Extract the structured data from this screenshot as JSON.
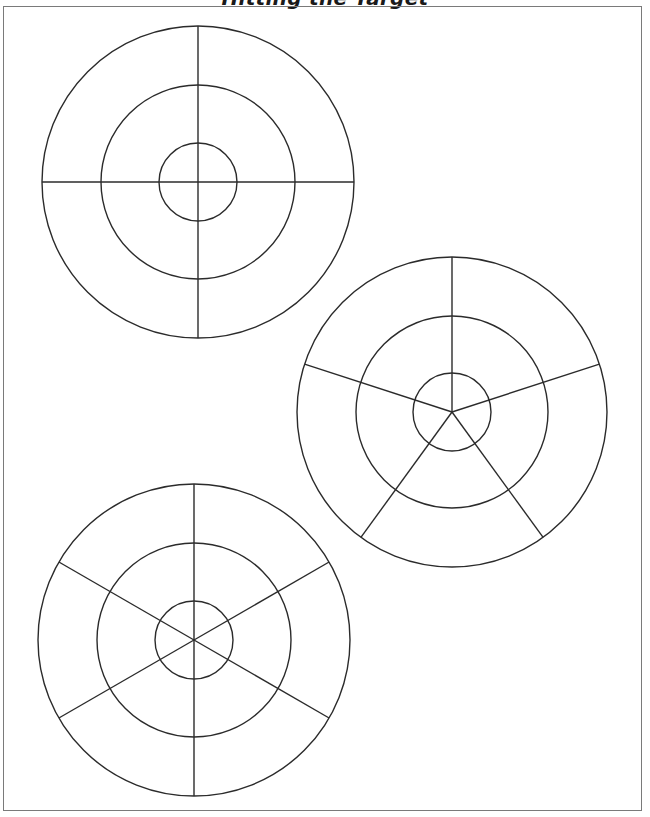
{
  "page": {
    "title": "Hitting the Target"
  },
  "style": {
    "line_color": "#2b2b2b",
    "frame_color": "#7a7a7a",
    "background": "#ffffff"
  },
  "targets": [
    {
      "name": "target-4-sections",
      "cx": 198,
      "cy": 182,
      "r_outer": 156,
      "r_middle": 97,
      "r_inner": 39,
      "spokes": 4
    },
    {
      "name": "target-5-sections",
      "cx": 452,
      "cy": 412,
      "r_outer": 155,
      "r_middle": 96,
      "r_inner": 39,
      "spokes": 5
    },
    {
      "name": "target-6-sections",
      "cx": 194,
      "cy": 640,
      "r_outer": 156,
      "r_middle": 97,
      "r_inner": 39,
      "spokes": 6
    }
  ]
}
